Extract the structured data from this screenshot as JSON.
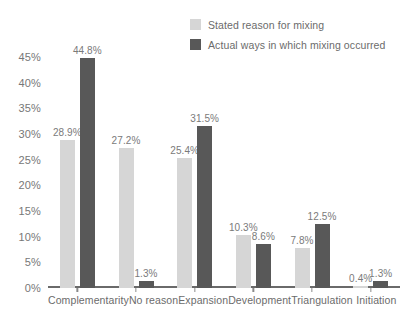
{
  "chart_data": {
    "type": "bar",
    "title": "",
    "subtitle": "",
    "xlabel": "",
    "ylabel": "",
    "ylim": [
      0,
      45
    ],
    "grid": false,
    "legend_position": "top-right",
    "ytick_labels": [
      "45%",
      "40%",
      "35%",
      "30%",
      "25%",
      "20%",
      "15%",
      "10%",
      "5%",
      "0%"
    ],
    "ytick_values": [
      45,
      40,
      35,
      30,
      25,
      20,
      15,
      10,
      5,
      0
    ],
    "categories": [
      "Complementarity",
      "No reason",
      "Expansion",
      "Development",
      "Triangulation",
      "Initiation"
    ],
    "series": [
      {
        "name": "Stated reason for mixing",
        "color": "#d6d6d6",
        "values": [
          28.9,
          27.2,
          25.4,
          10.3,
          7.8,
          0.4
        ],
        "labels": [
          "28.9%",
          "27.2%",
          "25.4%",
          "10.3%",
          "7.8%",
          "0.4%"
        ]
      },
      {
        "name": "Actual ways in which mixing occurred",
        "color": "#585858",
        "values": [
          44.8,
          1.3,
          31.5,
          8.6,
          12.5,
          1.3
        ],
        "labels": [
          "44.8%",
          "1.3%",
          "31.5%",
          "8.6%",
          "12.5%",
          "1.3%"
        ]
      }
    ]
  },
  "legend": {
    "items": [
      {
        "label": "Stated reason for mixing",
        "color": "#d6d6d6"
      },
      {
        "label": "Actual ways in which mixing occurred",
        "color": "#585858"
      }
    ]
  },
  "colors": {
    "series_light": "#d6d6d6",
    "series_dark": "#585858",
    "axis": "#6a6a6a",
    "text": "#6f6f6f",
    "background": "#ffffff"
  }
}
